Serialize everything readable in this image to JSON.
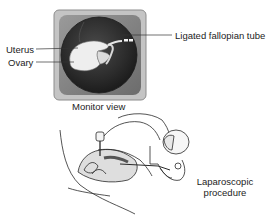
{
  "diagram": {
    "monitor": {
      "caption": "Monitor view",
      "labels": {
        "uterus": "Uterus",
        "ovary": "Ovary",
        "tube": "Ligated fallopian tube"
      }
    },
    "procedure": {
      "caption_line1": "Laparoscopic",
      "caption_line2": "procedure"
    },
    "colors": {
      "frame_outer": "#b9b9b9",
      "frame_inner": "#7d7d7d",
      "scope_view": "#2e2e2e",
      "organ": "#f2f2f2",
      "line": "#333333"
    }
  }
}
